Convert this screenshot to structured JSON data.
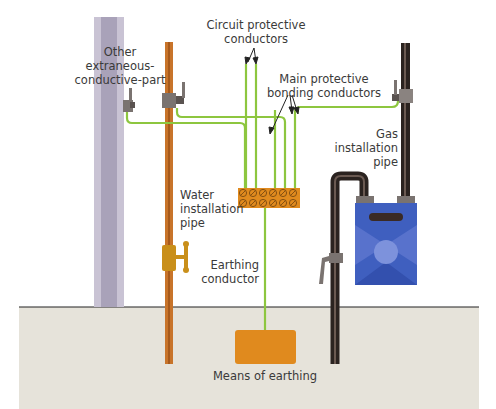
{
  "diagram": {
    "title_fragment": "",
    "labels": {
      "circuit_protective": [
        "Circuit protective",
        "conductors"
      ],
      "other_part": [
        "Other",
        "extraneous-",
        "conductive-part"
      ],
      "main_bonding": [
        "Main protective",
        "bonding conductors"
      ],
      "gas_pipe": [
        "Gas",
        "installation",
        "pipe"
      ],
      "water_pipe": [
        "Water",
        "installation",
        "pipe"
      ],
      "earthing_conductor": [
        "Earthing",
        "conductor"
      ],
      "means_of_earthing": "Means of earthing"
    },
    "colors": {
      "conductor_green": "#8dc63f",
      "copper_pipe": "#c8742a",
      "gas_pipe": "#2b2320",
      "column": "#b9b3c4",
      "column_dark": "#a39db2",
      "clamp": "#7a7370",
      "terminal_block": "#e08a1e",
      "earth_electrode": "#e08a1e",
      "ground": "#e6e3da",
      "meter_blue": "#3f5fbf",
      "meter_light": "#6e86d6",
      "stopcock": "#c98f1a"
    }
  }
}
